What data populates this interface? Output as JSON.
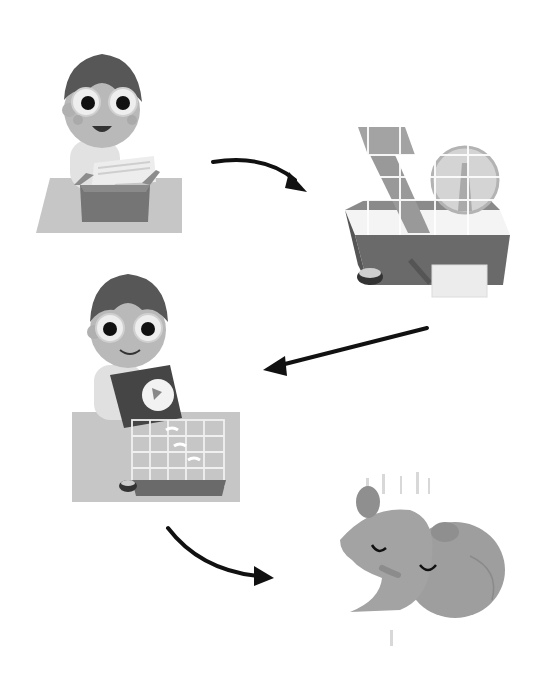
{
  "steps": [
    {
      "id": 1,
      "label": "Boy unpacking box with bedding"
    },
    {
      "id": 2,
      "label": "Hamster cage with wheel and ramp"
    },
    {
      "id": 3,
      "label": "Boy pouring bedding into cage"
    },
    {
      "id": 4,
      "label": "Sleeping hamster"
    }
  ],
  "arrows": [
    {
      "from": 1,
      "to": 2,
      "direction": "right-curved-down"
    },
    {
      "from": 2,
      "to": 3,
      "direction": "left"
    },
    {
      "from": 3,
      "to": 4,
      "direction": "right-curved"
    }
  ],
  "colors": {
    "background": "#ffffff",
    "arrow": "#111111",
    "mat": "#c8c8c8",
    "box": "#7a7a7a",
    "skin": "#b4b4b4",
    "hair": "#555555",
    "hamster": "#9e9e9e"
  }
}
